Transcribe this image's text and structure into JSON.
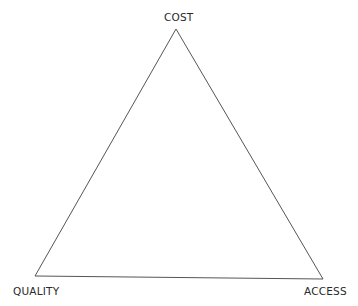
{
  "diagram": {
    "type": "triangle",
    "vertices": [
      {
        "id": "top",
        "label": "COST",
        "x": 176,
        "y": 29
      },
      {
        "id": "bottom-left",
        "label": "QUALITY",
        "x": 35,
        "y": 276
      },
      {
        "id": "bottom-right",
        "label": "ACCESS",
        "x": 323,
        "y": 279
      }
    ],
    "stroke_color": "#555555",
    "background": "#ffffff"
  }
}
